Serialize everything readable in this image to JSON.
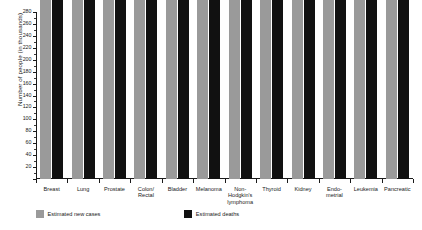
{
  "chart_data": {
    "type": "bar",
    "title": "",
    "xlabel": "",
    "ylabel": "Number of people (in thousands)",
    "ylim": [
      0,
      280
    ],
    "ytick_step": 20,
    "yticks": [
      0,
      20,
      40,
      60,
      80,
      100,
      120,
      140,
      160,
      180,
      200,
      220,
      240,
      260,
      280
    ],
    "ytick_labels": [
      "",
      "20",
      "40",
      "60",
      "80",
      "100",
      "120",
      "140",
      "160",
      "180",
      "200",
      "220",
      "240",
      "260",
      "280"
    ],
    "grid": false,
    "legend_position": "bottom-left",
    "categories": [
      "Breast",
      "Lung",
      "Prostate",
      "Colon/\nRectal",
      "Bladder",
      "Melanoma",
      "Non-\nHodgkin's\nlymphoma",
      "Thyroid",
      "Kidney",
      "Endo-\nmetrial",
      "Leukemia",
      "Pancreatic"
    ],
    "series": [
      {
        "name": "Estimated new cases",
        "color": "#9a9a9a",
        "values": [
          234000,
          224000,
          220800,
          136000,
          74000,
          76100,
          70800,
          62450,
          63900,
          54870,
          52380,
          46420
        ],
        "labels": [
          "234,000",
          "224,000",
          "220,800",
          "136,000",
          "74,000",
          "76,100",
          "70,800",
          "62,450",
          "63,900",
          "54,870",
          "52,380",
          "46,420"
        ]
      },
      {
        "name": "Estimated deaths",
        "color": "#111111",
        "values": [
          40730,
          159000,
          27540,
          50310,
          16000,
          9710,
          18990,
          1950,
          13860,
          10170,
          24090,
          40560
        ],
        "labels": [
          "40,730",
          "159,000",
          "27,540",
          "50,310",
          "16,000",
          "9,710",
          "18,990",
          "1,950",
          "13,860",
          "10,170",
          "24,090",
          "40,560"
        ]
      }
    ]
  },
  "legend": {
    "items": [
      {
        "label": "Estimated new cases",
        "swatch": "cases"
      },
      {
        "label": "Estimated deaths",
        "swatch": "deaths"
      }
    ]
  }
}
